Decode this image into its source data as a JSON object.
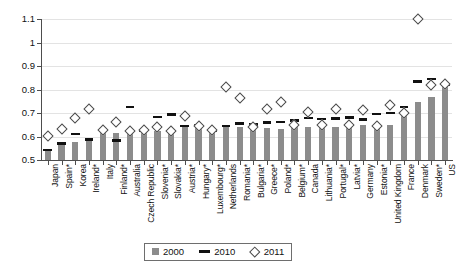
{
  "chart_data": {
    "type": "bar",
    "title": "",
    "subtitle": "",
    "xlabel": "",
    "ylabel": "",
    "ylim": [
      0.5,
      1.1
    ],
    "yticks": [
      0.5,
      0.6,
      0.7,
      0.8,
      0.9,
      1.0,
      1.1
    ],
    "ytick_labels": [
      "0.5",
      "0.6",
      "0.7",
      "0.8",
      "0.9",
      "1",
      "1.1"
    ],
    "grid": true,
    "legend_position": "bottom-center",
    "categories": [
      "Japan",
      "Spain*",
      "Korea",
      "Ireland*",
      "Italy",
      "Finland*",
      "Australia",
      "Czech Republic",
      "Slovenia*",
      "Slovakia*",
      "Austria*",
      "Hungary*",
      "Luxembourg*",
      "Netherlands",
      "Romania*",
      "Bulgaria*",
      "Greece*",
      "Poland*",
      "Belgium*",
      "Canada",
      "Lithuania*",
      "Portugal*",
      "Latvia*",
      "Germany",
      "Estonia*",
      "United Kingdom",
      "France",
      "Denmark",
      "Sweden*",
      "US"
    ],
    "series": [
      {
        "name": "2000",
        "marker": "bar",
        "color": "#8c8c8c",
        "values": [
          0.543,
          0.57,
          0.576,
          0.586,
          0.621,
          0.617,
          0.622,
          0.626,
          0.624,
          0.623,
          0.645,
          0.646,
          0.626,
          0.645,
          0.639,
          0.638,
          0.636,
          0.634,
          0.648,
          0.64,
          0.644,
          0.641,
          0.645,
          0.647,
          0.645,
          0.651,
          0.7,
          0.745,
          0.77,
          0.81
        ]
      },
      {
        "name": "2010",
        "marker": "dash",
        "color": "#111111",
        "values": [
          0.543,
          0.57,
          0.611,
          0.587,
          0.628,
          0.583,
          0.726,
          0.626,
          0.682,
          0.693,
          0.645,
          0.646,
          0.626,
          0.645,
          0.655,
          0.652,
          0.659,
          0.662,
          0.669,
          0.678,
          0.675,
          0.677,
          0.68,
          0.672,
          0.695,
          0.7,
          0.725,
          0.835,
          0.845,
          0.822
        ]
      },
      {
        "name": "2011",
        "marker": "diamond",
        "color": "#ffffff",
        "values": [
          0.602,
          0.632,
          0.678,
          0.715,
          0.628,
          0.66,
          0.622,
          0.626,
          0.641,
          0.624,
          0.688,
          0.646,
          0.626,
          0.81,
          0.762,
          0.642,
          0.718,
          0.745,
          0.648,
          0.706,
          0.649,
          0.716,
          0.651,
          0.712,
          0.645,
          0.732,
          0.7,
          1.1,
          0.82,
          0.822
        ]
      }
    ],
    "legend": [
      {
        "label": "2000",
        "marker": "bar"
      },
      {
        "label": "2010",
        "marker": "dash"
      },
      {
        "label": "2011",
        "marker": "diamond"
      }
    ]
  }
}
